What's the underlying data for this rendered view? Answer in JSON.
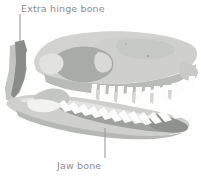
{
  "figure": {
    "background_color": "#ffffff",
    "width": 201,
    "height": 176
  },
  "annotations": [
    {
      "id": "extra-hinge-bone",
      "label": "Extra hinge bone",
      "text_color": "#8d8d8d",
      "leader_color": "#9a9a9a",
      "leader": {
        "x1": 20,
        "y1": 14,
        "x2": 20,
        "y2": 44
      }
    },
    {
      "id": "jaw-bone",
      "label": "Jaw bone",
      "text_color": "#8d8d8d",
      "leader_color": "#9a9a9a",
      "leader": {
        "x1": 105,
        "y1": 128,
        "x2": 105,
        "y2": 158
      }
    }
  ],
  "palette": {
    "cranium_light": "#d2d3cf",
    "cranium_mid": "#c3c5c0",
    "cranium_pale": "#dcddd9",
    "muscle_shadow": "#a9aba6",
    "dark_accent": "#8f918c",
    "hinge_bone_dark": "#8a8c87",
    "jaw_light": "#cfd0cc",
    "jaw_shadow": "#b4b6b1",
    "teeth_white": "#fdfdfd",
    "teeth_shade": "#e8e9e6",
    "outline": "#b8bab5"
  },
  "parts": [
    {
      "name": "cranium-dome",
      "tone": "cranium_light"
    },
    {
      "name": "snout",
      "tone": "cranium_light"
    },
    {
      "name": "temporal-fenestra",
      "tone": "muscle_shadow"
    },
    {
      "name": "orbit",
      "tone": "cranium_pale"
    },
    {
      "name": "zygomatic-arch",
      "tone": "cranium_mid"
    },
    {
      "name": "quadrate-hinge-bone",
      "tone": "hinge_bone_dark"
    },
    {
      "name": "occipital-strut",
      "tone": "cranium_mid"
    },
    {
      "name": "upper-tooth-row",
      "tone": "teeth_white"
    },
    {
      "name": "lower-jaw",
      "tone": "jaw_light"
    },
    {
      "name": "lower-tooth-row",
      "tone": "teeth_white"
    },
    {
      "name": "jaw-articulation",
      "tone": "dark_accent"
    }
  ]
}
